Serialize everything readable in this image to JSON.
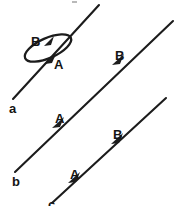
{
  "figure": {
    "background_color": "#ffffff",
    "ink_color": "#1c1c1c",
    "width": 178,
    "height": 206,
    "lines": [
      {
        "id": "a",
        "name": "line-a",
        "label": "a",
        "label_x": 10,
        "label_y": 110,
        "x1": 13,
        "y1": 99,
        "x2": 99,
        "y2": 5,
        "has_loop": true,
        "markers": [
          {
            "label": "A",
            "label_x": 54,
            "label_y": 67,
            "point_x": 52,
            "point_y": 59
          },
          {
            "label": "B",
            "label_x": 32,
            "label_y": 45,
            "point_x": 47,
            "point_y": 43
          }
        ]
      },
      {
        "id": "b",
        "name": "line-b",
        "label": "b",
        "label_x": 12,
        "label_y": 183,
        "x1": 15,
        "y1": 172,
        "x2": 173,
        "y2": 21,
        "has_loop": false,
        "markers": [
          {
            "label": "A",
            "label_x": 56,
            "label_y": 122,
            "point_x": 59,
            "point_y": 126
          },
          {
            "label": "B",
            "label_x": 116,
            "label_y": 59,
            "point_x": 119,
            "point_y": 63
          }
        ]
      },
      {
        "id": "c",
        "name": "line-c",
        "label": "c",
        "label_x": 50,
        "label_y": 206,
        "x1": 52,
        "y1": 202,
        "x2": 166,
        "y2": 98,
        "has_loop": false,
        "markers": [
          {
            "label": "A",
            "label_x": 71,
            "label_y": 177,
            "point_x": 75,
            "point_y": 181
          },
          {
            "label": "B",
            "label_x": 114,
            "label_y": 138,
            "point_x": 118,
            "point_y": 142
          }
        ]
      }
    ],
    "loop": {
      "name": "loop-around-line-a",
      "center_x": 48,
      "center_y": 48,
      "rx": 25,
      "ry": 9,
      "rotation_deg": -22
    }
  }
}
